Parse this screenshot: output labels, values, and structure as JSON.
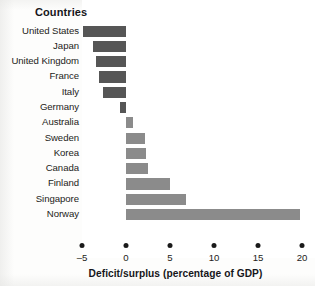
{
  "header": {
    "countries_label": "Countries"
  },
  "chart_data": {
    "type": "bar",
    "orientation": "horizontal",
    "title": "",
    "xlabel": "Deficit/surplus (percentage of GDP)",
    "ylabel": "Countries",
    "xlim": [
      -5,
      20
    ],
    "ticks": [
      -5,
      0,
      5,
      10,
      15,
      20
    ],
    "tick_labels": [
      "–5",
      "0",
      "5",
      "10",
      "15",
      "20"
    ],
    "grid": false,
    "legend": false,
    "zero_line": 0,
    "categories": [
      "United States",
      "Japan",
      "United Kingdom",
      "France",
      "Italy",
      "Germany",
      "Australia",
      "Sweden",
      "Korea",
      "Canada",
      "Finland",
      "Singapore",
      "Norway"
    ],
    "values": [
      -4.9,
      -3.8,
      -3.4,
      -3.1,
      -2.6,
      -0.7,
      0.8,
      2.2,
      2.3,
      2.5,
      5.0,
      6.8,
      19.8
    ],
    "bars": [
      {
        "label": "United States",
        "value": -4.9
      },
      {
        "label": "Japan",
        "value": -3.8
      },
      {
        "label": "United Kingdom",
        "value": -3.4
      },
      {
        "label": "France",
        "value": -3.1
      },
      {
        "label": "Italy",
        "value": -2.6
      },
      {
        "label": "Germany",
        "value": -0.7
      },
      {
        "label": "Australia",
        "value": 0.8
      },
      {
        "label": "Sweden",
        "value": 2.2
      },
      {
        "label": "Korea",
        "value": 2.3
      },
      {
        "label": "Canada",
        "value": 2.5
      },
      {
        "label": "Finland",
        "value": 5.0
      },
      {
        "label": "Singapore",
        "value": 6.8
      },
      {
        "label": "Norway",
        "value": 19.8
      }
    ],
    "colors": {
      "negative_bar": "#565656",
      "positive_bar": "#8b8b8b",
      "text": "#1c1c20",
      "background": "#ffffff"
    }
  }
}
